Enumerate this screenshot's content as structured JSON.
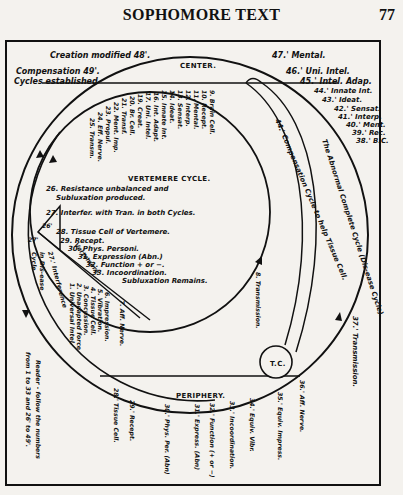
{
  "header": {
    "title": "SOPHOMORE TEXT",
    "page_number": "77"
  },
  "diagram": {
    "region_labels": {
      "center": "CENTER.",
      "periphery": "PERIPHERY.",
      "vertemere_cycle": "VERTEMERE CYCLE.",
      "tissue_cell_circle": "T.C."
    },
    "top_left_notes": {
      "creation": "Creation modified 48'.",
      "compensation": "Compensation 49'.",
      "cycles": "Cycles established"
    },
    "center_arc_items": [
      "9. Brain Cell.",
      "10. Recept.",
      "11. Mental.",
      "12. Interp.",
      "13. Sensat.",
      "14. Ideat.",
      "15. Innate Int.",
      "16. Int. Adapt.",
      "17. Uni. Intel.",
      "19. Creat.",
      "20. Br. Cell.",
      "21. Transf.",
      "22. Ment. Imp.",
      "23. Propul.",
      "24. Eff. Nerve.",
      "25. Transm."
    ],
    "right_top_items": [
      "47.' Mental.",
      "46.' Uni. Intel.",
      "45.' Intel. Adap.",
      "44.' Innate Int.",
      "43.' Ideat.",
      "42.' Sensat.",
      "41.' Interp.",
      "40.' Ment.",
      "39.' Rec.",
      "38.' B.C."
    ],
    "vertemere_items": {
      "item26_line1": "26. Resistance unbalanced and",
      "item26_line2": "Subluxation produced.",
      "item27": "27. Interfer. with Tran. in both Cycles.",
      "item28": "28. Tissue Cell of Vertemere.",
      "item29": "29. Recept.",
      "item30": "30. Phys. Personi.",
      "item31": "31. Expression (Abn.)",
      "item32": "32. Function + or −.",
      "item33": "33. Incoordination.",
      "subluxation_remains": "Subluxation Remains."
    },
    "arc_labels": {
      "compensation_cycle": "44.' Compensation Cycle to help Tissue Cell.",
      "abnormal_cycle": "The Abnormal Complete Cycle (Dis-ease Cycle).",
      "transmission_8": "8. Transmission.",
      "transmission_37": "37.' Transmission.",
      "vertemere_diag": "Vertemere.",
      "interference_27": "27.' Interference",
      "in_disease_cycle": "in Dis-ease",
      "cycle_word": "Cycle",
      "label_26p": "26'",
      "label_27p": "27'"
    },
    "lower_left_items": [
      "1. Universal Intel.",
      "2. Unadapted force",
      "3. Concussion.",
      "4. Tissue Cell.",
      "5. Vibration.",
      "6. Impression.",
      "7. Aff. Nerve."
    ],
    "periphery_items": [
      "28.' Tissue Cell.",
      "29.' Recept.",
      "30.' Phys. Per. (Abn)",
      "31.' Express. (Abn)",
      "32.' Function (+ or −)",
      "33.' Incoordination.",
      "34.' Equiv. Vibr.",
      "35.' Equiv. Impress.",
      "36.' Aff. Nerve."
    ],
    "reader_note": {
      "line1": "Reader - follow the numbers",
      "line2": "from 1 to 33 and 26' to 49'."
    }
  }
}
